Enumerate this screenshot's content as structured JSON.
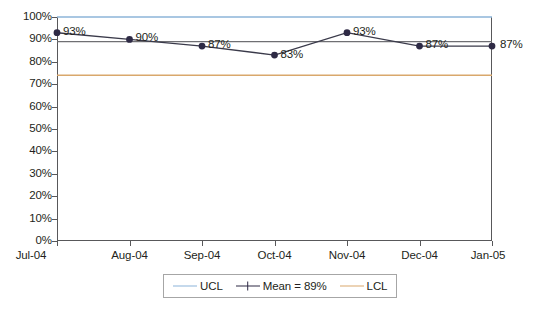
{
  "chart_data": {
    "type": "line",
    "title": "",
    "subtitle": "",
    "xlabel": "",
    "ylabel": "",
    "categories": [
      "Jul-04",
      "Aug-04",
      "Sep-04",
      "Oct-04",
      "Nov-04",
      "Dec-04",
      "Jan-05"
    ],
    "series": [
      {
        "name": "Mean = 89%",
        "values": [
          93,
          90,
          87,
          83,
          93,
          87,
          87
        ],
        "point_labels": [
          "93%",
          "90%",
          "87%",
          "83%",
          "93%",
          "87%",
          "87%"
        ],
        "color": "#2e2a45",
        "marker": "circle"
      },
      {
        "name": "UCL",
        "constant_value": 100,
        "color": "#8cb4d9",
        "marker": "none"
      },
      {
        "name": "LCL",
        "constant_value": 74,
        "color": "#d9a86c",
        "marker": "none"
      },
      {
        "name": "Mean line",
        "constant_value": 89,
        "color": "#6f6f73",
        "marker": "none"
      }
    ],
    "ylim": [
      0,
      100
    ],
    "y_tick_labels": [
      "100%",
      "90%",
      "80%",
      "70%",
      "60%",
      "50%",
      "40%",
      "30%",
      "20%",
      "10%",
      "0%"
    ],
    "y_tick_values": [
      100,
      90,
      80,
      70,
      60,
      50,
      40,
      30,
      20,
      10,
      0
    ],
    "grid": false,
    "legend_position": "bottom"
  },
  "legend": {
    "entries": [
      {
        "label": "UCL",
        "color": "#8cb4d9",
        "marker": false
      },
      {
        "label": "Mean = 89%",
        "color": "#2e2a45",
        "marker": true
      },
      {
        "label": "LCL",
        "color": "#d9a86c",
        "marker": false
      }
    ]
  },
  "colors": {
    "ucl": "#8cb4d9",
    "lcl": "#d9a86c",
    "mean_line": "#6f6f73",
    "series_line": "#3a3a4a",
    "marker": "#2e2a45",
    "axis": "#58585a",
    "text": "#231f20",
    "background": "#ffffff"
  }
}
